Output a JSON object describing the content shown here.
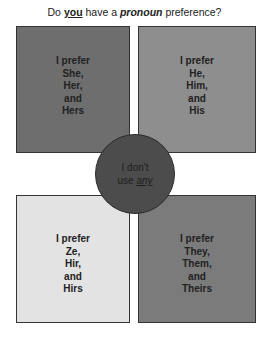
{
  "title": {
    "part1": "Do ",
    "you": "you",
    "part2": " have a ",
    "pronoun": "pronoun",
    "part3": " preference?"
  },
  "boxes": {
    "top_left": {
      "lines": [
        "I prefer",
        "She,",
        "Her,",
        "and",
        "Hers"
      ],
      "color": "#6e6e6e"
    },
    "top_right": {
      "lines": [
        "I prefer",
        "He,",
        "Him,",
        "and",
        "His"
      ],
      "color": "#8e8e8e"
    },
    "bottom_left": {
      "lines": [
        "I prefer",
        "Ze,",
        "Hir,",
        "and",
        "Hirs"
      ],
      "color": "#e3e3e3"
    },
    "bottom_right": {
      "lines": [
        "I prefer",
        "They,",
        "Them,",
        "and",
        "Theirs"
      ],
      "color": "#7b7b7b"
    }
  },
  "circle": {
    "line1": "I don't",
    "line2a": "use ",
    "line2b": "any",
    "color": "#4c4c4c"
  }
}
